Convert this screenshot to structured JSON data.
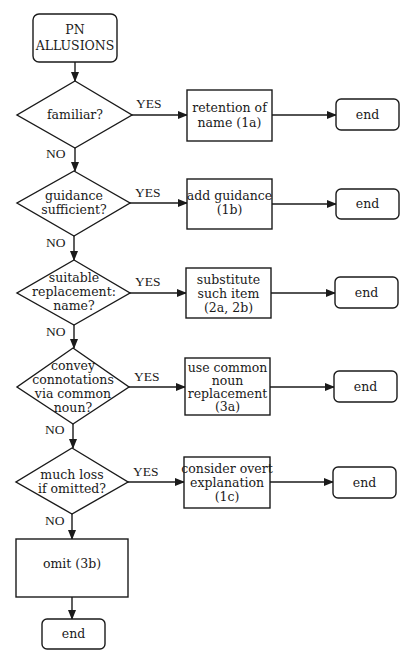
{
  "diagram": {
    "type": "flowchart",
    "start": {
      "lines": [
        "PN",
        "ALLUSIONS"
      ]
    },
    "branch_labels": {
      "yes": "YES",
      "no": "NO"
    },
    "decisions": [
      {
        "lines": [
          "familiar?"
        ]
      },
      {
        "lines": [
          "guidance",
          "sufficient?"
        ]
      },
      {
        "lines": [
          "suitable",
          "replacement:",
          "name?"
        ]
      },
      {
        "lines": [
          "convey",
          "connotations",
          "via common",
          "noun?"
        ]
      },
      {
        "lines": [
          "much loss",
          "if omitted?"
        ]
      }
    ],
    "actions": [
      {
        "lines": [
          "retention of",
          "name (1a)"
        ]
      },
      {
        "lines": [
          "add guidance",
          "(1b)"
        ]
      },
      {
        "lines": [
          "substitute",
          "such item",
          "(2a, 2b)"
        ]
      },
      {
        "lines": [
          "use common",
          "noun",
          "replacement",
          "(3a)"
        ]
      },
      {
        "lines": [
          "consider overt",
          "explanation",
          "(1c)"
        ]
      }
    ],
    "terminals": [
      "end",
      "end",
      "end",
      "end",
      "end"
    ],
    "fallback": {
      "label": "omit (3b)"
    },
    "final_terminal": "end"
  }
}
